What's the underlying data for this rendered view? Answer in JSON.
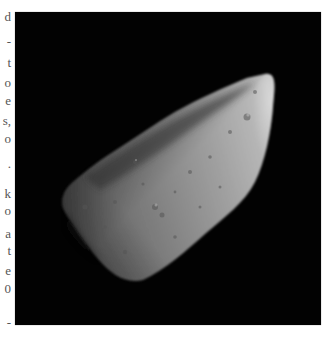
{
  "left_text_column": {
    "fragments": [
      {
        "text": "d",
        "y": 10
      },
      {
        "text": "-",
        "y": 35
      },
      {
        "text": "t",
        "y": 56
      },
      {
        "text": "o",
        "y": 76
      },
      {
        "text": "e",
        "y": 94
      },
      {
        "text": "s,",
        "y": 114
      },
      {
        "text": "o",
        "y": 132
      },
      {
        "text": ".",
        "y": 157
      },
      {
        "text": "k",
        "y": 187
      },
      {
        "text": "o",
        "y": 204
      },
      {
        "text": "a",
        "y": 227
      },
      {
        "text": "t",
        "y": 244
      },
      {
        "text": "e",
        "y": 264
      },
      {
        "text": "0",
        "y": 282
      },
      {
        "text": "-",
        "y": 316
      }
    ]
  },
  "figure": {
    "background_color": "#020202",
    "surface_color": "#9a9a9a",
    "highlight_color": "#d8d8d8"
  }
}
